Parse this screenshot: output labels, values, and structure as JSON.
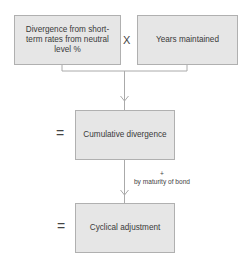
{
  "diagram": {
    "boxes": {
      "divergence": "Divergence from short-term rates from neutral level %",
      "years": "Years maintained",
      "cumulative": "Cumulative divergence",
      "cyclical": "Cyclical adjustment"
    },
    "operators": {
      "multiply": "X",
      "equals_1": "=",
      "equals_2": "="
    },
    "annotation": {
      "symbol": "+",
      "text": "by maturity of bond"
    },
    "colors": {
      "box_fill": "#e6e6e6",
      "box_border": "#b0b0b0",
      "line": "#aaaaaa"
    }
  }
}
